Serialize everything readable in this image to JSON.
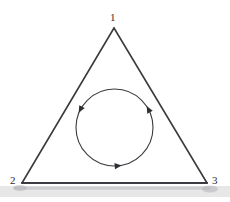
{
  "figure": {
    "kind": "line-diagram",
    "background_color": "#ffffff",
    "stroke_color": "#3a3a40",
    "label_color": "#2e2e33",
    "width": 230,
    "height": 202
  },
  "triangle": {
    "name": "equilateral-triangle",
    "stroke_width": 1.6,
    "vertices": [
      {
        "label": "1",
        "x": 114,
        "y": 28,
        "position": "top-apex"
      },
      {
        "label": "2",
        "x": 22,
        "y": 183,
        "position": "bottom-left"
      },
      {
        "label": "3",
        "x": 207,
        "y": 183,
        "position": "bottom-right"
      }
    ],
    "base_stroke_width": 2.1
  },
  "circle": {
    "name": "inscribed-circulation-circle",
    "center_x": 114.5,
    "center_y": 127.5,
    "radius": 38.5,
    "stroke_width": 1.1,
    "direction": "counterclockwise",
    "arrowheads": [
      {
        "name": "arrowhead-upper-left",
        "angle_deg": 152,
        "points": "down-left"
      },
      {
        "name": "arrowhead-right",
        "angle_deg": 28,
        "points": "down-right"
      },
      {
        "name": "arrowhead-bottom",
        "angle_deg": 275,
        "points": "right"
      }
    ]
  },
  "artifacts": {
    "scan_smudge": {
      "name": "scan-smudge-band",
      "x": 0,
      "y": 186,
      "width": 230,
      "height": 12,
      "color": "#c9c9cc"
    }
  }
}
